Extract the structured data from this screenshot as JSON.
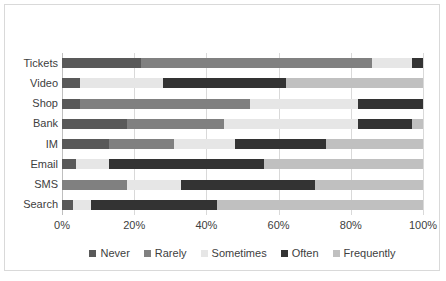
{
  "chart_data": {
    "type": "bar",
    "orientation": "horizontal",
    "stacked": true,
    "stack_mode": "percent",
    "title": "",
    "subtitle": "",
    "xlabel": "",
    "ylabel": "",
    "xlim": [
      0,
      100
    ],
    "xticks": [
      0,
      20,
      40,
      60,
      80,
      100
    ],
    "xtick_labels": [
      "0%",
      "20%",
      "40%",
      "60%",
      "80%",
      "100%"
    ],
    "grid": true,
    "grid_axis": "x",
    "legend_position": "bottom",
    "categories": [
      "Tickets",
      "Video",
      "Shop",
      "Bank",
      "IM",
      "Email",
      "SMS",
      "Search"
    ],
    "series": [
      {
        "name": "Never",
        "color": "#595959",
        "values": [
          22,
          5,
          5,
          18,
          13,
          4,
          0,
          3
        ]
      },
      {
        "name": "Rarely",
        "color": "#808080",
        "values": [
          64,
          0,
          47,
          27,
          18,
          0,
          18,
          0
        ]
      },
      {
        "name": "Sometimes",
        "color": "#e6e6e6",
        "values": [
          11,
          23,
          30,
          37,
          17,
          9,
          15,
          5
        ]
      },
      {
        "name": "Often",
        "color": "#333333",
        "values": [
          3,
          34,
          18,
          15,
          25,
          43,
          37,
          35
        ]
      },
      {
        "name": "Frequently",
        "color": "#c0c0c0",
        "values": [
          0,
          38,
          0,
          3,
          27,
          44,
          30,
          57
        ]
      }
    ]
  },
  "legend": {
    "items": [
      {
        "label": "Never",
        "color": "#595959"
      },
      {
        "label": "Rarely",
        "color": "#808080"
      },
      {
        "label": "Sometimes",
        "color": "#e6e6e6"
      },
      {
        "label": "Often",
        "color": "#333333"
      },
      {
        "label": "Frequently",
        "color": "#c0c0c0"
      }
    ]
  },
  "style": {
    "plot_background": "#ffffff",
    "frame_border": "#d9d9d9",
    "gridline_color": "#d9d9d9",
    "axis_color": "#bfbfbf",
    "text_color": "#404040"
  }
}
